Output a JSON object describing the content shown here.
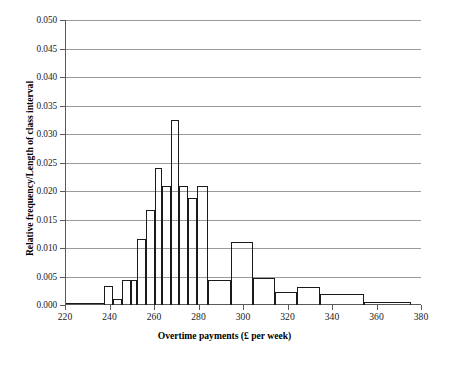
{
  "chart_data": {
    "type": "bar",
    "title": "",
    "subtitle": "",
    "xlabel": "Overtime payments (£ per week)",
    "ylabel": "Relative frequency/Length of class interval",
    "xlim": [
      220,
      380
    ],
    "ylim": [
      0.0,
      0.05
    ],
    "xticks": [
      220,
      240,
      260,
      280,
      300,
      320,
      340,
      360,
      380
    ],
    "yticks": [
      0.0,
      0.005,
      0.01,
      0.015,
      0.02,
      0.025,
      0.03,
      0.035,
      0.04,
      0.045,
      0.05
    ],
    "xtick_labels": [
      "220",
      "240",
      "260",
      "280",
      "300",
      "320",
      "340",
      "360",
      "380"
    ],
    "ytick_labels": [
      "0.000",
      "0.005",
      "0.010",
      "0.015",
      "0.020",
      "0.025",
      "0.030",
      "0.035",
      "0.040",
      "0.045",
      "0.050"
    ],
    "grid": true,
    "grid_axis": "y",
    "legend": false,
    "legend_position": "none",
    "bar_style": "open-outline",
    "bar_edge_color": "#1a1a1a",
    "bar_fill_color": "#ffffff",
    "grid_color": "#9a9a9a",
    "axis_color": "#5a5a5a",
    "bins": [
      {
        "x0": 220,
        "x1": 237,
        "value": 0.0
      },
      {
        "x0": 237,
        "x1": 241,
        "value": 0.0033
      },
      {
        "x0": 241,
        "x1": 245,
        "value": 0.0011
      },
      {
        "x0": 245,
        "x1": 249,
        "value": 0.0043
      },
      {
        "x0": 249,
        "x1": 252,
        "value": 0.0044
      },
      {
        "x0": 252,
        "x1": 256,
        "value": 0.0115
      },
      {
        "x0": 256,
        "x1": 260,
        "value": 0.0167
      },
      {
        "x0": 260,
        "x1": 263,
        "value": 0.024
      },
      {
        "x0": 263,
        "x1": 267,
        "value": 0.0209
      },
      {
        "x0": 267,
        "x1": 271,
        "value": 0.0325
      },
      {
        "x0": 271,
        "x1": 275,
        "value": 0.0209
      },
      {
        "x0": 275,
        "x1": 279,
        "value": 0.0188
      },
      {
        "x0": 279,
        "x1": 284,
        "value": 0.0209
      },
      {
        "x0": 284,
        "x1": 294,
        "value": 0.0044
      },
      {
        "x0": 294,
        "x1": 304,
        "value": 0.011
      },
      {
        "x0": 304,
        "x1": 314,
        "value": 0.0048
      },
      {
        "x0": 314,
        "x1": 324,
        "value": 0.0022
      },
      {
        "x0": 324,
        "x1": 334,
        "value": 0.0031
      },
      {
        "x0": 334,
        "x1": 354,
        "value": 0.0019
      },
      {
        "x0": 354,
        "x1": 375,
        "value": 0.0006
      }
    ]
  }
}
